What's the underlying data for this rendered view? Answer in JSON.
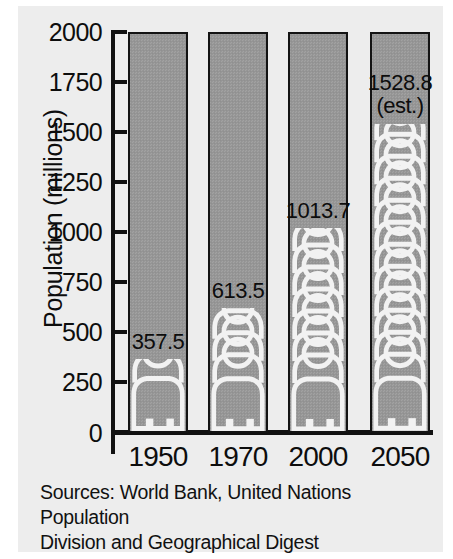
{
  "chart_data": {
    "type": "bar",
    "title": "",
    "subtitle": "",
    "xlabel": "",
    "ylabel": "Population (millions)",
    "categories": [
      "1950",
      "1970",
      "2000",
      "2050"
    ],
    "values": [
      357.5,
      613.5,
      1013.7,
      1528.8
    ],
    "value_labels": [
      "357.5",
      "613.5",
      "1013.7",
      "1528.8"
    ],
    "annotations": [
      "",
      "",
      "",
      "(est.)"
    ],
    "ylim": [
      0,
      2000
    ],
    "yticks": [
      0,
      250,
      500,
      750,
      1000,
      1250,
      1500,
      1750,
      2000
    ],
    "ytick_labels": [
      "0",
      "250",
      "500",
      "750",
      "1000",
      "1250",
      "1500",
      "1750",
      "2000"
    ],
    "grid": false,
    "legend": null,
    "series": [
      {
        "name": "Population",
        "values": [
          357.5,
          613.5,
          1013.7,
          1528.8
        ]
      }
    ],
    "marker_style": "stacked-person-pictogram",
    "colors": {
      "bar_fill": "#989898",
      "bar_border": "#131313",
      "pictogram_outline": "#f2f2f2",
      "background": "#ededed",
      "text": "#0d0d0d"
    }
  },
  "source_note": {
    "line1": "Sources: World Bank, United Nations Population",
    "line2": "Division and Geographical Digest"
  }
}
